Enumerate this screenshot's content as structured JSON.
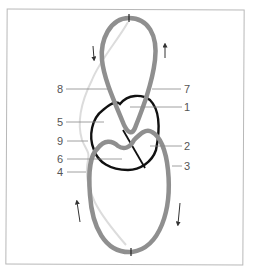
{
  "diagram": {
    "type": "anatomical-loop-diagram",
    "colors": {
      "outer_loop": "#8f8f8f",
      "inner_heart": "#111111",
      "faint_path": "#d8d8d8",
      "label_text": "#555555",
      "leader_line": "#888888",
      "frame": "#b8b8b8"
    },
    "labels": [
      {
        "id": "8",
        "text": "8",
        "side": "left"
      },
      {
        "id": "7",
        "text": "7",
        "side": "right"
      },
      {
        "id": "1",
        "text": "1",
        "side": "right"
      },
      {
        "id": "5",
        "text": "5",
        "side": "left"
      },
      {
        "id": "9",
        "text": "9",
        "side": "left"
      },
      {
        "id": "2",
        "text": "2",
        "side": "right"
      },
      {
        "id": "6",
        "text": "6",
        "side": "left"
      },
      {
        "id": "3",
        "text": "3",
        "side": "right"
      },
      {
        "id": "4",
        "text": "4",
        "side": "left"
      }
    ],
    "arrows": [
      {
        "position": "upper-left",
        "direction": "down"
      },
      {
        "position": "upper-right",
        "direction": "up"
      },
      {
        "position": "lower-left",
        "direction": "up"
      },
      {
        "position": "lower-right",
        "direction": "down"
      }
    ]
  }
}
